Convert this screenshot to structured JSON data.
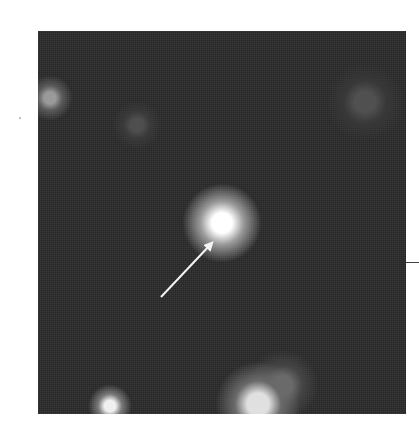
{
  "image": {
    "description": "Grayscale astronomical image of a star field with a bright point source at center indicated by a white arrow",
    "background_color": "#2a2a2a",
    "frame": {
      "left": 38,
      "top": 31,
      "width": 368,
      "height": 383
    },
    "sources": [
      {
        "name": "central-bright-source",
        "x": 222,
        "y": 223,
        "radius": 22,
        "core_color": "#ffffff",
        "glow_color": "#9a9a9a"
      },
      {
        "name": "upper-left-faint-source",
        "x": 50,
        "y": 98,
        "radius": 13,
        "core_color": "#9a9a9a",
        "glow_color": "#5a5a5a"
      },
      {
        "name": "upper-middle-faint-source",
        "x": 137,
        "y": 125,
        "radius": 14,
        "core_color": "#4e4e4e",
        "glow_color": "#3a3a3a"
      },
      {
        "name": "upper-right-faint-source",
        "x": 365,
        "y": 102,
        "radius": 22,
        "core_color": "#505050",
        "glow_color": "#383838"
      },
      {
        "name": "bottom-left-bright-source",
        "x": 110,
        "y": 406,
        "radius": 12,
        "core_color": "#f0f0f0",
        "glow_color": "#7a7a7a"
      },
      {
        "name": "bottom-right-bright-source",
        "x": 258,
        "y": 404,
        "radius": 24,
        "core_color": "#e0e0e0",
        "glow_color": "#6a6a6a"
      },
      {
        "name": "bottom-right-diffuse-source",
        "x": 283,
        "y": 385,
        "radius": 20,
        "core_color": "#6a6a6a",
        "glow_color": "#454545"
      }
    ],
    "annotations": {
      "arrow": {
        "from": [
          161,
          297
        ],
        "to": [
          211,
          244
        ],
        "color": "#f4f4f4"
      },
      "right_tick_mark": {
        "y": 262
      }
    }
  }
}
